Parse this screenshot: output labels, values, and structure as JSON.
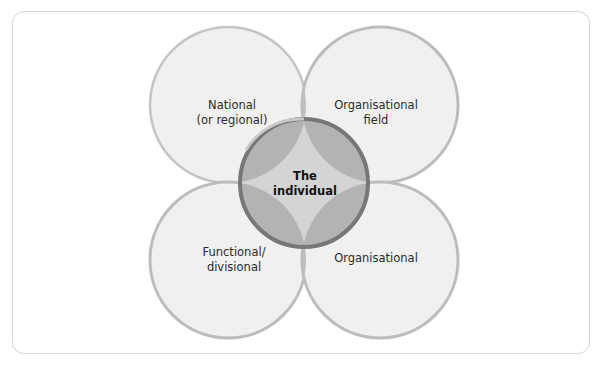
{
  "diagram": {
    "type": "overlapping-circles",
    "circles": [
      {
        "id": "national",
        "lines": [
          "National",
          "(or regional)"
        ],
        "cx": 228,
        "cy": 105,
        "r": 78
      },
      {
        "id": "organisational-field",
        "lines": [
          "Organisational",
          "field"
        ],
        "cx": 380,
        "cy": 105,
        "r": 78
      },
      {
        "id": "functional-divisional",
        "lines": [
          "Functional/",
          "divisional"
        ],
        "cx": 228,
        "cy": 260,
        "r": 78
      },
      {
        "id": "organisational",
        "lines": [
          "Organisational"
        ],
        "cx": 380,
        "cy": 260,
        "r": 78
      }
    ],
    "center": {
      "id": "the-individual",
      "lines": [
        "The",
        "individual"
      ],
      "cx": 304,
      "cy": 183,
      "r": 64
    },
    "colors": {
      "outer_fill": "#f0f0f0",
      "outer_stroke": "#bcbcbc",
      "overlap_fill": "#b8b8b8",
      "center_fill": "#a9a9a9",
      "center_core": "#d2d2d2",
      "center_stroke": "#6e6e6e",
      "frame_border": "#d4d4d4"
    }
  }
}
